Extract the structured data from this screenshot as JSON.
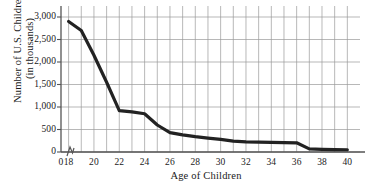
{
  "chart_data": {
    "type": "line",
    "title": "",
    "xlabel": "Age of Children",
    "ylabel": "Number of U.S. Children (in thousands)",
    "ylabel_line1": "Number of U.S. Children",
    "ylabel_line2": "(in thousands)",
    "xlim": [
      17,
      41
    ],
    "ylim": [
      0,
      3000
    ],
    "x_ticklabels": [
      "0",
      "18",
      "20",
      "22",
      "24",
      "26",
      "28",
      "30",
      "32",
      "34",
      "36",
      "38",
      "40"
    ],
    "x_tickvalues": [
      0,
      18,
      20,
      22,
      24,
      26,
      28,
      30,
      32,
      34,
      36,
      38,
      40
    ],
    "y_ticklabels": [
      "0",
      "500",
      "1,000",
      "1,500",
      "2,000",
      "2,500",
      "3,000"
    ],
    "y_tickvalues": [
      0,
      500,
      1000,
      1500,
      2000,
      2500,
      3000
    ],
    "grid": true,
    "grid_x_step": 1,
    "grid_y_step": 500,
    "axis_break": true,
    "legend": "none",
    "line_color": "#222222",
    "grid_color": "#9a9a9a",
    "axis_color": "#555555",
    "background": "#ffffff",
    "x": [
      18,
      19,
      20,
      21,
      22,
      23,
      24,
      25,
      26,
      27,
      28,
      29,
      30,
      31,
      32,
      33,
      34,
      35,
      36,
      37,
      38,
      39,
      40
    ],
    "values": [
      2900,
      2700,
      2150,
      1550,
      920,
      890,
      850,
      600,
      430,
      380,
      340,
      310,
      280,
      240,
      225,
      220,
      215,
      210,
      205,
      70,
      60,
      55,
      50
    ],
    "series": [
      {
        "name": "Number of U.S. Children",
        "values": [
          2900,
          2700,
          2150,
          1550,
          920,
          890,
          850,
          600,
          430,
          380,
          340,
          310,
          280,
          240,
          225,
          220,
          215,
          210,
          205,
          70,
          60,
          55,
          50
        ]
      }
    ]
  }
}
